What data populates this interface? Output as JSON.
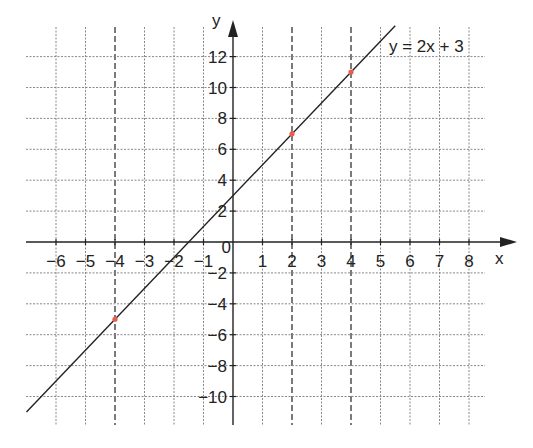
{
  "chart_data": {
    "type": "line",
    "title": "",
    "xlabel": "x",
    "ylabel": "y",
    "equation_label": "y = 2x + 3",
    "xlim": [
      -7,
      9
    ],
    "ylim": [
      -11,
      13
    ],
    "grid": true,
    "x_ticks": [
      -6,
      -5,
      -4,
      -3,
      -2,
      -1,
      0,
      1,
      2,
      3,
      4,
      5,
      6,
      7,
      8
    ],
    "x_tick_labels": [
      "−6",
      "−5",
      "−4",
      "−3",
      "−2",
      "−1",
      "0",
      "1",
      "2",
      "3",
      "4",
      "5",
      "6",
      "7",
      "8"
    ],
    "y_ticks": [
      -10,
      -8,
      -6,
      -4,
      -2,
      2,
      4,
      6,
      8,
      10,
      12
    ],
    "y_tick_labels": [
      "−10",
      "−8",
      "−6",
      "−4",
      "−2",
      "2",
      "4",
      "6",
      "8",
      "10",
      "12"
    ],
    "series": [
      {
        "name": "y = 2x + 3",
        "slope": 2,
        "intercept": 3,
        "x": [
          -7,
          5.5
        ],
        "y": [
          -11,
          14
        ],
        "color": "#222222"
      }
    ],
    "highlighted_points": [
      {
        "x": -4,
        "y": -5,
        "color": "#f05a4a"
      },
      {
        "x": 2,
        "y": 7,
        "color": "#f05a4a"
      },
      {
        "x": 4,
        "y": 11,
        "color": "#f05a4a"
      }
    ],
    "emphasized_gridlines_x": [
      -4,
      2,
      4
    ]
  }
}
